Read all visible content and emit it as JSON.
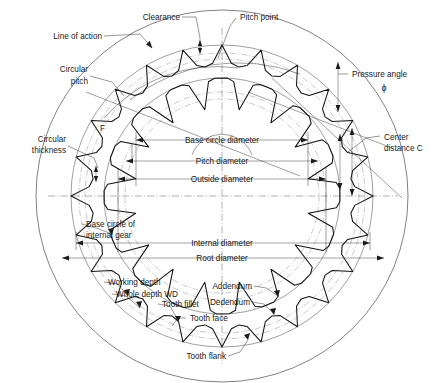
{
  "figure": {
    "type": "engineering-line-drawing",
    "background_color": "#ffffff",
    "line_color": "#1a1a1a"
  },
  "labels": {
    "line_of_action": "Line of action",
    "clearance": "Clearance",
    "pitch_point": "Pitch point",
    "circular_pitch_1": "Circular",
    "circular_pitch_2": "pitch",
    "pressure_angle": "Pressure angle",
    "pressure_angle_symbol": "ϕ",
    "circular_thickness_1": "Circular",
    "circular_thickness_2": "thickness",
    "face_width": "F",
    "base_circle_diameter": "Base circle diameter",
    "pitch_diameter": "Pitch diameter",
    "outside_diameter": "Outside diameter",
    "center_distance_1": "Center",
    "center_distance_2": "distance C",
    "base_circle_internal_1": "Base circle of",
    "base_circle_internal_2": "internal gear",
    "internal_diameter": "Internal diameter",
    "root_diameter": "Root diameter",
    "working_depth": "Working depth",
    "whole_depth": "Whole depth WD",
    "addendum": "Addendum",
    "dedendum": "Dedendum",
    "tooth_fillet": "Tooth fillet",
    "tooth_face": "Tooth face",
    "tooth_flank": "Tooth flank"
  },
  "geometry": {
    "center_x": 222,
    "center_y": 196,
    "outer_rim_radius": 186,
    "internal_root_radius": 152,
    "internal_tip_radius": 128,
    "internal_pitch_radius": 140,
    "internal_base_circle_radius": 133,
    "internal_tooth_count": 24,
    "pinion_center_x": 222,
    "pinion_center_y": 196,
    "pinion_outside_radius": 118,
    "pinion_pitch_radius": 104,
    "pinion_root_radius": 88,
    "pinion_base_radius": 97,
    "pinion_tooth_count": 16
  }
}
